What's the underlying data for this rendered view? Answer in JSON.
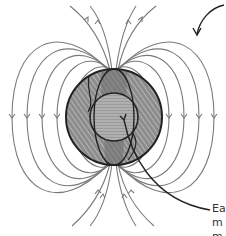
{
  "diagram": {
    "colors": {
      "field_line": "#7a7a7a",
      "earth_fill": "#8c8c8c",
      "earth_outline": "#222222",
      "pointer": "#222222",
      "text": "#333333"
    },
    "labels": {
      "line1": "Ea",
      "line2": "m",
      "line3": "m"
    }
  }
}
